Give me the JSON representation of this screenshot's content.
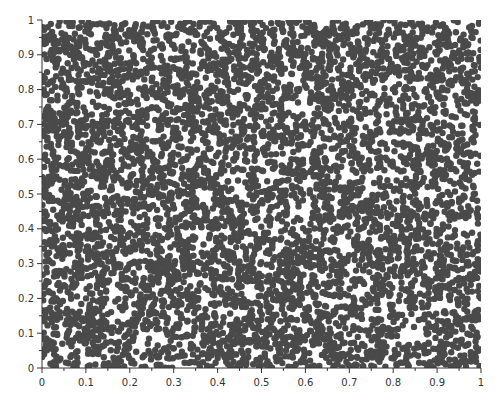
{
  "chart_data": {
    "type": "scatter",
    "title": "",
    "xlabel": "",
    "ylabel": "",
    "xlim": [
      0,
      1
    ],
    "ylim": [
      0,
      1
    ],
    "grid": false,
    "legend": null,
    "x_ticks": [
      "0",
      "0.1",
      "0.2",
      "0.3",
      "0.4",
      "0.5",
      "0.6",
      "0.7",
      "0.8",
      "0.9",
      "1"
    ],
    "y_ticks": [
      "0",
      "0.1",
      "0.2",
      "0.3",
      "0.4",
      "0.5",
      "0.6",
      "0.7",
      "0.8",
      "0.9",
      "1"
    ],
    "series": [
      {
        "name": "random points",
        "distribution": "uniform random on [0,1] x [0,1]",
        "approx_count": 6000,
        "marker": "filled circle",
        "marker_radius_px": 3.2,
        "color": "#4a4a4a"
      }
    ]
  },
  "colors": {
    "background": "#ffffff",
    "axis": "#333333",
    "points": "#4a4a4a"
  }
}
